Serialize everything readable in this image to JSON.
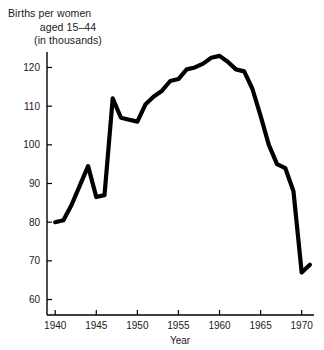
{
  "chart_data": {
    "type": "line",
    "title_lines": [
      "Births per women",
      "aged 15–44",
      "(in thousands)"
    ],
    "xlabel": "Year",
    "ylabel": "",
    "xlim": [
      1939,
      1971.5
    ],
    "ylim": [
      56,
      124
    ],
    "grid": false,
    "legend": "none",
    "line_color": "#000000",
    "background_color": "#ffffff",
    "x_ticks": [
      1940,
      1945,
      1950,
      1955,
      1960,
      1965,
      1970
    ],
    "x_tick_labels": [
      "1940",
      "1945",
      "1950",
      "1955",
      "1960",
      "1965",
      "1970"
    ],
    "y_ticks": [
      60,
      70,
      80,
      90,
      100,
      110,
      120
    ],
    "y_tick_labels": [
      "60",
      "70",
      "80",
      "90",
      "100",
      "110",
      "120"
    ],
    "x": [
      1940,
      1941,
      1942,
      1943,
      1944,
      1945,
      1946,
      1947,
      1948,
      1949,
      1950,
      1951,
      1952,
      1953,
      1954,
      1955,
      1956,
      1957,
      1958,
      1959,
      1960,
      1961,
      1962,
      1963,
      1964,
      1965,
      1966,
      1967,
      1968,
      1969,
      1970,
      1971
    ],
    "values": [
      80.0,
      80.5,
      84.5,
      89.5,
      94.5,
      86.5,
      87.0,
      112.0,
      107.0,
      106.5,
      106.0,
      110.5,
      112.5,
      114.0,
      116.5,
      117.0,
      119.5,
      120.0,
      121.0,
      122.5,
      123.0,
      121.5,
      119.5,
      119.0,
      114.5,
      107.5,
      100.0,
      95.0,
      94.0,
      88.0,
      67.0,
      69.0
    ],
    "series_name": "Births per women aged 15-44"
  },
  "axis": {
    "x_axis_label": "Year"
  }
}
